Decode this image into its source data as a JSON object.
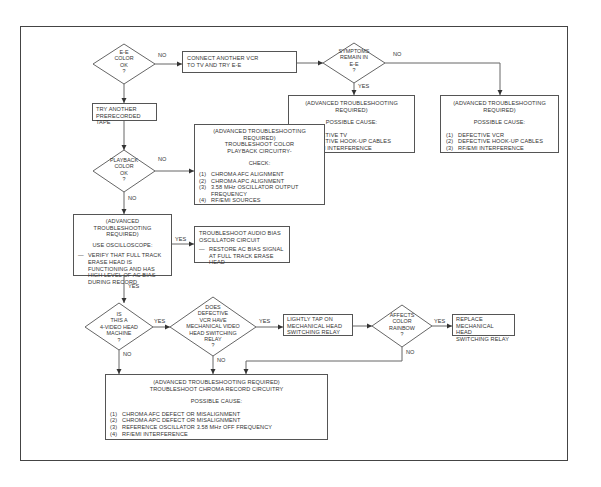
{
  "flowchart": {
    "title": "VCR color troubleshooting flowchart",
    "nodes": {
      "ee_color_ok": {
        "type": "decision",
        "lines": [
          "E-E",
          "COLOR",
          "OK",
          "?"
        ]
      },
      "connect_another_vcr": {
        "type": "process",
        "lines": [
          "CONNECT ANOTHER VCR",
          "TO TV AND TRY E-E"
        ]
      },
      "symptoms_remain": {
        "type": "decision",
        "lines": [
          "SYMPTOMS",
          "REMAIN IN",
          "E-E",
          "?"
        ]
      },
      "adv_defective_tv": {
        "type": "process",
        "header": [
          "(ADVANCED TROUBLESHOOTING",
          "REQUIRED)"
        ],
        "subheader": "POSSIBLE CAUSE:",
        "items": [
          {
            "n": "(1)",
            "text": "DEFECTIVE TV"
          },
          {
            "n": "(2)",
            "text": "DEFECTIVE HOOK-UP CABLES"
          },
          {
            "n": "(3)",
            "text": "RF/EMI INTERFERENCE"
          }
        ]
      },
      "adv_defective_vcr": {
        "type": "process",
        "header": [
          "(ADVANCED TROUBLESHOOTING",
          "REQUIRED)"
        ],
        "subheader": "POSSIBLE CAUSE:",
        "items": [
          {
            "n": "(1)",
            "text": "DEFECTIVE VCR"
          },
          {
            "n": "(2)",
            "text": "DEFECTIVE HOOK-UP CABLES"
          },
          {
            "n": "(3)",
            "text": "RF/EMI INTERFERENCE"
          }
        ]
      },
      "try_another_tape": {
        "type": "process",
        "lines": [
          "TRY ANOTHER",
          "PRERECORDED TAPE"
        ]
      },
      "playback_color_ok": {
        "type": "decision",
        "lines": [
          "PLAYBACK",
          "COLOR",
          "OK",
          "?"
        ]
      },
      "adv_playback_circuitry": {
        "type": "process",
        "header": [
          "(ADVANCED TROUBLESHOOTING",
          "REQUIRED)",
          "TROUBLESHOOT COLOR",
          "PLAYBACK CIRCUITRY-"
        ],
        "subheader": "CHECK:",
        "items": [
          {
            "n": "(1)",
            "text": "CHROMA AFC ALIGNMENT"
          },
          {
            "n": "(2)",
            "text": "CHROMA APC ALIGNMENT"
          },
          {
            "n": "(3)",
            "text": "3.58 MHz OSCILLATOR OUTPUT FREQUENCY"
          },
          {
            "n": "(4)",
            "text": "RF/EMI SOURCES"
          }
        ]
      },
      "adv_oscilloscope": {
        "type": "process",
        "header": [
          "(ADVANCED TROUBLESHOOTING",
          "REQUIRED)"
        ],
        "subheader": "USE OSCILLOSCOPE:",
        "dash_item": "VERIFY THAT FULL TRACK ERASE HEAD IS FUNCTIONING AND HAS HIGH LEVEL OF AC BIAS DURING RECORD"
      },
      "audio_bias": {
        "type": "process",
        "lines": [
          "TROUBLESHOOT AUDIO BIAS",
          "OSCILLATOR CIRCUIT"
        ],
        "dash_item": "RESTORE AC BIAS SIGNAL AT FULL TRACK ERASE HEAD"
      },
      "four_video_head": {
        "type": "decision",
        "lines": [
          "IS",
          "THIS A",
          "4-VIDEO HEAD",
          "MACHINE",
          "?"
        ]
      },
      "mechanical_relay": {
        "type": "decision",
        "lines": [
          "DOES",
          "DEFECTIVE",
          "VCR HAVE",
          "MECHANICAL VIDEO",
          "HEAD SWITCHING",
          "RELAY",
          "?"
        ]
      },
      "tap_relay": {
        "type": "process",
        "lines": [
          "LIGHTLY TAP ON",
          "MECHANICAL HEAD",
          "SWITCHING RELAY"
        ]
      },
      "affects_rainbow": {
        "type": "decision",
        "lines": [
          "AFFECTS",
          "COLOR",
          "RAINBOW",
          "?"
        ]
      },
      "replace_relay": {
        "type": "process",
        "lines": [
          "REPLACE",
          "MECHANICAL HEAD",
          "SWITCHING RELAY"
        ]
      },
      "adv_chroma_record": {
        "type": "process",
        "header": [
          "(ADVANCED TROUBLESHOOTING REQUIRED)",
          "TROUBLESHOOT CHROMA RECORD CIRCUITRY"
        ],
        "subheader": "POSSIBLE CAUSE:",
        "items": [
          {
            "n": "(1)",
            "text": "CHROMA AFC DEFECT OR MISALIGNMENT"
          },
          {
            "n": "(2)",
            "text": "CHROMA APC DEFECT OR MISALIGNMENT"
          },
          {
            "n": "(3)",
            "text": "REFERENCE OSCILLATOR 3.58 MHz OFF FREQUENCY"
          },
          {
            "n": "(4)",
            "text": "RF/EMI INTERFERENCE"
          }
        ]
      }
    },
    "edge_labels": {
      "ee_no": "NO",
      "symptoms_no": "NO",
      "symptoms_yes": "YES",
      "playback_no_right": "NO",
      "playback_no_down": "NO",
      "osc_yes_right": "YES",
      "osc_yes_down": "YES",
      "four_head_yes": "YES",
      "four_head_no": "NO",
      "relay_yes": "YES",
      "relay_no": "NO",
      "rainbow_yes": "YES",
      "rainbow_no": "NO"
    },
    "colors": {
      "line": "#555555",
      "text": "#333333",
      "background": "#ffffff",
      "frame": "#444444"
    }
  }
}
